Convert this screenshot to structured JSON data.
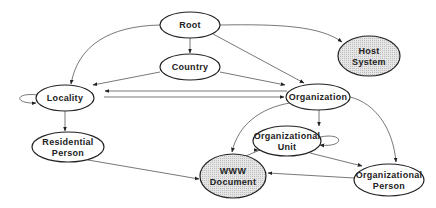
{
  "diagram": {
    "title": "",
    "colors": {
      "plain_fill": "#ffffff",
      "shaded_fill": "#dcdcdc",
      "stroke": "#222222",
      "edge": "#555555"
    },
    "nodes": [
      {
        "id": "root",
        "label": [
          "Root"
        ],
        "cx": 190,
        "cy": 25,
        "rx": 30,
        "ry": 13,
        "shaded": false
      },
      {
        "id": "country",
        "label": [
          "Country"
        ],
        "cx": 190,
        "cy": 67,
        "rx": 30,
        "ry": 13,
        "shaded": false
      },
      {
        "id": "host-system",
        "label": [
          "Host",
          "System"
        ],
        "cx": 369,
        "cy": 56,
        "rx": 31,
        "ry": 20,
        "shaded": true
      },
      {
        "id": "locality",
        "label": [
          "Locality"
        ],
        "cx": 65,
        "cy": 98,
        "rx": 29,
        "ry": 13,
        "shaded": false
      },
      {
        "id": "organization",
        "label": [
          "Organization"
        ],
        "cx": 318,
        "cy": 97,
        "rx": 32,
        "ry": 13,
        "shaded": false
      },
      {
        "id": "residential-person",
        "label": [
          "Residential",
          "Person"
        ],
        "cx": 68,
        "cy": 147,
        "rx": 36,
        "ry": 15,
        "shaded": false
      },
      {
        "id": "organizational-unit",
        "label": [
          "Organizational",
          "Unit"
        ],
        "cx": 287,
        "cy": 141,
        "rx": 34,
        "ry": 15,
        "shaded": false
      },
      {
        "id": "www-document",
        "label": [
          "WWW",
          "Document"
        ],
        "cx": 233,
        "cy": 176,
        "rx": 33,
        "ry": 22,
        "shaded": true
      },
      {
        "id": "organizational-person",
        "label": [
          "Organizational",
          "Person"
        ],
        "cx": 389,
        "cy": 180,
        "rx": 35,
        "ry": 16,
        "shaded": false
      }
    ],
    "edges": [
      {
        "from": "root",
        "to": "country",
        "path": "M190,38 L190,53"
      },
      {
        "from": "root",
        "to": "locality",
        "path": "M160,25 C110,26 78,45 71,84"
      },
      {
        "from": "root",
        "to": "host-system",
        "path": "M220,25 C280,24 320,26 342,42"
      },
      {
        "from": "root",
        "to": "organization",
        "path": "M213,34 L304,83"
      },
      {
        "from": "country",
        "to": "locality",
        "path": "M160,72 L93,85"
      },
      {
        "from": "country",
        "to": "organization",
        "path": "M220,72 L285,85"
      },
      {
        "from": "organization",
        "to": "locality",
        "path": "M287,91 L105,91"
      },
      {
        "from": "locality",
        "to": "organization",
        "path": "M104,97 L284,97"
      },
      {
        "from": "locality",
        "to": "locality",
        "path": "M38,95 C14,92 14,104 36,103"
      },
      {
        "from": "locality",
        "to": "residential-person",
        "path": "M65,111 L65,131"
      },
      {
        "from": "residential-person",
        "to": "www-document",
        "path": "M88,160 L199,179"
      },
      {
        "from": "organization",
        "to": "www-document",
        "path": "M290,103 C260,108 238,125 232,152"
      },
      {
        "from": "organization",
        "to": "organizational-unit",
        "path": "M319,110 L319,126"
      },
      {
        "from": "organization",
        "to": "organizational-person",
        "path": "M350,97 C375,103 393,128 396,162"
      },
      {
        "from": "organizational-unit",
        "to": "www-document",
        "path": "M258,150 L262,150 L258,150 L258,150"
      },
      {
        "from": "organizational-unit",
        "to": "www-document-2",
        "path": "M260,150 L241,158"
      },
      {
        "from": "organizational-unit",
        "to": "organizational-person",
        "path": "M310,153 L362,166"
      },
      {
        "from": "organizational-unit",
        "to": "organizational-unit",
        "path": "M320,137 C345,132 345,148 320,145"
      },
      {
        "from": "organizational-person",
        "to": "www-document",
        "path": "M354,178 L268,173"
      }
    ]
  }
}
